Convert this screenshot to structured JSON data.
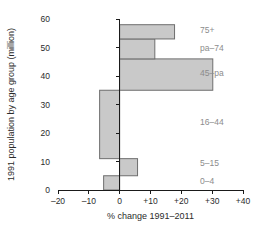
{
  "chart_data": {
    "type": "bar",
    "orientation": "horizontal",
    "title": "",
    "xlabel": "% change 1991–2011",
    "ylabel": "1991 population by age group (million)",
    "xlim": [
      -20,
      40
    ],
    "ylim": [
      0,
      60
    ],
    "xticks": [
      -20,
      -10,
      0,
      10,
      20,
      30,
      40
    ],
    "xtick_labels": [
      "–20",
      "–10",
      "0",
      "+10",
      "+20",
      "+30",
      "+40"
    ],
    "yticks": [
      0,
      10,
      20,
      30,
      40,
      50,
      60
    ],
    "ytick_labels": [
      "0",
      "10",
      "20",
      "30",
      "40",
      "50",
      "60"
    ],
    "grid": false,
    "legend": false,
    "bar_color": "#c9c9c9",
    "bar_edge_color": "#6e6e6e",
    "categories": [
      "0–4",
      "5–15",
      "16–44",
      "45–pa",
      "pa–74",
      "75+"
    ],
    "bars": [
      {
        "label": "0–4",
        "y_start": 0,
        "y_end": 5,
        "value": -5.2
      },
      {
        "label": "5–15",
        "y_start": 5,
        "y_end": 11,
        "value": 5.8
      },
      {
        "label": "16–44",
        "y_start": 11,
        "y_end": 35,
        "value": -6.5
      },
      {
        "label": "45–pa",
        "y_start": 35,
        "y_end": 46,
        "value": 30.2
      },
      {
        "label": "pa–74",
        "y_start": 46,
        "y_end": 53,
        "value": 11.4
      },
      {
        "label": "75+",
        "y_start": 53,
        "y_end": 58,
        "value": 17.8
      }
    ],
    "category_label_positions": [
      {
        "label": "0–4",
        "y": 3
      },
      {
        "label": "5–15",
        "y": 9.5
      },
      {
        "label": "16–44",
        "y": 24
      },
      {
        "label": "45–pa",
        "y": 41
      },
      {
        "label": "pa–74",
        "y": 50
      },
      {
        "label": "75+",
        "y": 56
      }
    ]
  }
}
